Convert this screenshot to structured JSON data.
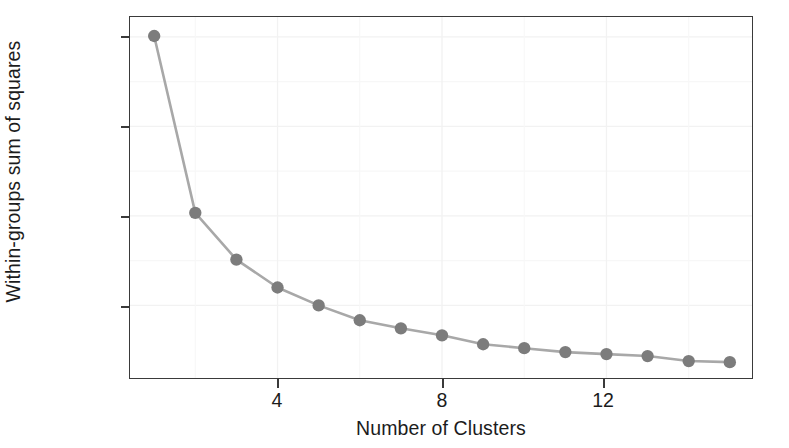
{
  "chart_data": {
    "type": "line",
    "title": "",
    "xlabel": "Number of Clusters",
    "ylabel": "Within-groups sum of squares",
    "x": [
      1,
      2,
      3,
      4,
      5,
      6,
      7,
      8,
      9,
      10,
      11,
      12,
      13,
      14,
      15
    ],
    "values": [
      2005,
      1017,
      756,
      600,
      500,
      417,
      372,
      333,
      283,
      261,
      239,
      228,
      217,
      189,
      183
    ],
    "series": [
      {
        "name": "Within-groups sum of squares",
        "values": [
          2005,
          1017,
          756,
          600,
          500,
          417,
          372,
          333,
          283,
          261,
          239,
          228,
          217,
          189,
          183
        ]
      }
    ],
    "xlim": [
      0.5,
      15.6
    ],
    "ylim": [
      150,
      2090
    ],
    "xticks": [
      4,
      8,
      12
    ],
    "xtick_labels": [
      "4",
      "8",
      "12"
    ],
    "yticks": [
      500,
      1000,
      1500,
      2000
    ],
    "ytick_labels": [
      "500",
      "1000",
      "1500",
      "2000"
    ],
    "grid": true,
    "legend": "none",
    "marker": "circle",
    "marker_color": "#7c7c7c",
    "line_color": "#a8a8a8",
    "axis_color": "#3a3a3a",
    "grid_color": "#f2f2f2",
    "background": "#ffffff"
  }
}
